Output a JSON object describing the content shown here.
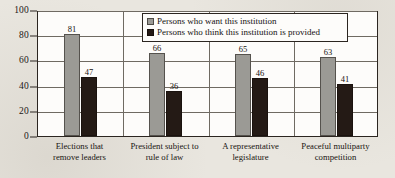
{
  "chart_data": {
    "type": "bar",
    "title": "",
    "xlabel": "",
    "ylabel": "",
    "ylim": [
      0,
      100
    ],
    "yticks": [
      0,
      20,
      40,
      60,
      80,
      100
    ],
    "grid": true,
    "legend_position": "top-right",
    "categories": [
      "Elections that remove leaders",
      "President subject to rule of law",
      "A representative legislature",
      "Peaceful multiparty competition"
    ],
    "category_lines": [
      [
        "Elections that",
        "remove leaders"
      ],
      [
        "President subject to",
        "rule of law"
      ],
      [
        "A representative",
        "legislature"
      ],
      [
        "Peaceful multiparty",
        "competition"
      ]
    ],
    "series": [
      {
        "name": "Persons who want this institution",
        "color": "#9b9a95",
        "values": [
          81,
          66,
          65,
          63
        ]
      },
      {
        "name": "Persons who think this institution is provided",
        "color": "#241a15",
        "values": [
          47,
          36,
          46,
          41
        ]
      }
    ]
  },
  "legend": {
    "items": [
      {
        "label": "Persons who want this institution",
        "swatch": "want"
      },
      {
        "label": "Persons who think this institution is provided",
        "swatch": "provided"
      }
    ]
  },
  "axis": {
    "y_tick_labels": [
      "100",
      "80",
      "60",
      "40",
      "20",
      "0"
    ]
  }
}
